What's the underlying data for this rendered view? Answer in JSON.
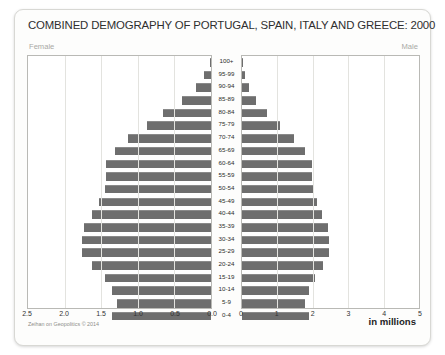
{
  "title": "COMBINED DEMOGRAPHY OF PORTUGAL, SPAIN, ITALY AND GREECE: 2000",
  "labels": {
    "female": "Female",
    "male": "Male",
    "units": "in millions",
    "credit": "Zeihan on Geopolitics © 2014"
  },
  "axes": {
    "female_ticks": [
      "2.5",
      "2.0",
      "1.5",
      "1.0",
      "0.5",
      "0.0"
    ],
    "male_ticks": [
      "0",
      "1",
      "2",
      "3",
      "4",
      "5"
    ]
  },
  "chart_data": {
    "type": "bar",
    "subtype": "population-pyramid",
    "title": "COMBINED DEMOGRAPHY OF PORTUGAL, SPAIN, ITALY AND GREECE: 2000",
    "xlabel": "in millions",
    "ylabel": "",
    "grid": true,
    "legend_position": "corners",
    "categories": [
      "100+",
      "95-99",
      "90-94",
      "85-89",
      "80-84",
      "75-79",
      "70-74",
      "65-69",
      "60-64",
      "55-59",
      "50-54",
      "45-49",
      "40-44",
      "35-39",
      "30-34",
      "25-29",
      "20-24",
      "15-19",
      "10-14",
      "5-9",
      "0-4"
    ],
    "series": [
      {
        "name": "Female",
        "axis_label": "Female",
        "xlim": [
          2.5,
          0.0
        ],
        "direction": "left",
        "values": [
          0.02,
          0.09,
          0.21,
          0.4,
          0.66,
          0.88,
          1.14,
          1.31,
          1.43,
          1.44,
          1.45,
          1.53,
          1.63,
          1.74,
          1.76,
          1.76,
          1.63,
          1.45,
          1.35,
          1.28,
          1.35
        ]
      },
      {
        "name": "Male",
        "axis_label": "Male",
        "xlim": [
          0,
          5
        ],
        "direction": "right",
        "values": [
          0.02,
          0.09,
          0.21,
          0.4,
          0.72,
          1.07,
          1.48,
          1.79,
          1.97,
          1.99,
          2.0,
          2.11,
          2.26,
          2.42,
          2.46,
          2.47,
          2.29,
          2.05,
          1.9,
          1.79,
          1.88
        ]
      }
    ]
  }
}
